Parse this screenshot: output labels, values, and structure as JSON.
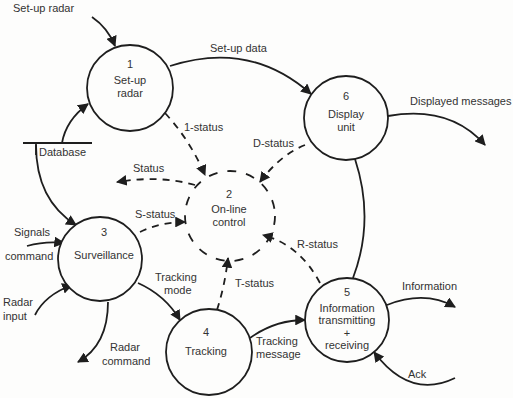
{
  "diagram": {
    "type": "data-flow-diagram",
    "processes": [
      {
        "id": "1",
        "number": "1",
        "line1": "Set-up",
        "line2": "radar"
      },
      {
        "id": "2",
        "number": "2",
        "line1": "On-line",
        "line2": "control"
      },
      {
        "id": "3",
        "number": "3",
        "line1": "Surveillance"
      },
      {
        "id": "4",
        "number": "4",
        "line1": "Tracking"
      },
      {
        "id": "5",
        "number": "5",
        "line1": "Information",
        "line2": "transmitting",
        "line3": "+",
        "line4": "receiving"
      },
      {
        "id": "6",
        "number": "6",
        "line1": "Display",
        "line2": "unit"
      }
    ],
    "store": {
      "label": "Database"
    },
    "flows": {
      "setup_radar": "Set-up radar",
      "setup_data": "Set-up data",
      "displayed_messages": "Displayed messages",
      "one_status": "1-status",
      "d_status": "D-status",
      "status": "Status",
      "s_status": "S-status",
      "signals": "Signals",
      "command": "command",
      "tracking_mode_1": "Tracking",
      "tracking_mode_2": "mode",
      "radar_input_1": "Radar",
      "radar_input_2": "input",
      "radar_command_1": "Radar",
      "radar_command_2": "command",
      "t_status": "T-status",
      "r_status": "R-status",
      "tracking_message_1": "Tracking",
      "tracking_message_2": "message",
      "information": "Information",
      "ack": "Ack"
    }
  }
}
